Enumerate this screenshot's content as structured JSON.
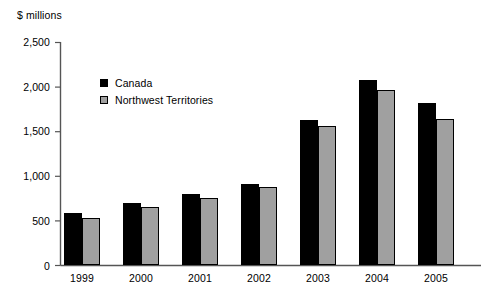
{
  "chart_data": {
    "type": "bar",
    "title": "",
    "subtitle": "",
    "xlabel": "",
    "ylabel": "$ millions",
    "categories": [
      "1999",
      "2000",
      "2001",
      "2002",
      "2003",
      "2004",
      "2005"
    ],
    "series": [
      {
        "name": "Canada",
        "color": "#000000",
        "values": [
          590,
          700,
          795,
          910,
          1630,
          2070,
          1820
        ]
      },
      {
        "name": "Northwest Territories",
        "color": "#a0a0a0",
        "values": [
          535,
          650,
          760,
          880,
          1565,
          1960,
          1640
        ]
      }
    ],
    "ylim": [
      0,
      2500
    ],
    "ytick_values": [
      0,
      500,
      1000,
      1500,
      2000,
      2500
    ],
    "ytick_labels": [
      "0",
      "500",
      "1,000",
      "1,500",
      "2,000",
      "2,500"
    ],
    "grid": false,
    "legend_position": "inside-upper-left",
    "annotations": []
  },
  "legend": {
    "items": [
      {
        "label": "Canada",
        "swatch": "legend-swatch-canada",
        "color": "#000000"
      },
      {
        "label": "Northwest Territories",
        "swatch": "legend-swatch-nwt",
        "color": "#a0a0a0"
      }
    ]
  },
  "axes": {
    "y_unit_label": "$ millions",
    "axis_color": "#555555"
  }
}
